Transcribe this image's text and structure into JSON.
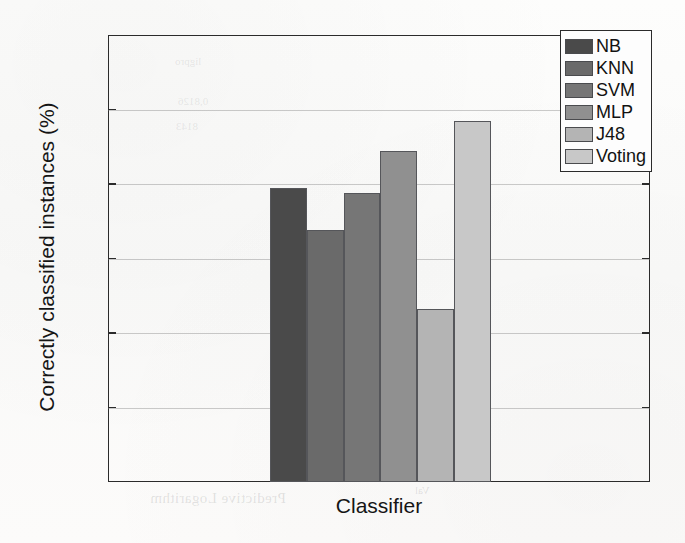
{
  "chart_data": {
    "type": "bar",
    "title": "",
    "xlabel": "Classifier",
    "ylabel": "Correctly classified instances (%)",
    "categories": [
      "NB",
      "KNN",
      "SVM",
      "MLP",
      "J48",
      "Voting"
    ],
    "values": [
      89.7,
      86.9,
      89.4,
      92.2,
      81.6,
      94.2
    ],
    "series": [
      {
        "name": "Correctly classified instances (%)",
        "values": [
          89.7,
          86.9,
          89.4,
          92.2,
          81.6,
          94.2
        ]
      }
    ],
    "ylim": [
      70,
      100
    ],
    "yticks": [
      70,
      75,
      80,
      85,
      90,
      95,
      100
    ],
    "ytick_labels": [
      "70",
      "75",
      "80",
      "85",
      "90",
      "95",
      "100"
    ],
    "xtick_labels": [],
    "grid": true,
    "grid_axis": "y",
    "legend_position": "upper right",
    "bar_colors": [
      "#4a4a4a",
      "#6a6a6a",
      "#767676",
      "#909090",
      "#b4b4b4",
      "#c8c8c8"
    ],
    "bar_edge_color": "#55565a",
    "legend": [
      {
        "label": "NB",
        "color": "#4a4a4a",
        "value": 89.7
      },
      {
        "label": "KNN",
        "color": "#6a6a6a",
        "value": 86.9
      },
      {
        "label": "SVM",
        "color": "#767676",
        "value": 89.4
      },
      {
        "label": "MLP",
        "color": "#909090",
        "value": 92.2
      },
      {
        "label": "J48",
        "color": "#b4b4b4",
        "value": 81.6
      },
      {
        "label": "Voting",
        "color": "#c8c8c8",
        "value": 94.2
      }
    ]
  },
  "axes": {
    "x_title": "Classifier",
    "y_title": "Correctly classified instances (%)"
  },
  "background_bleed": {
    "line_a": "Predictive Logarithm",
    "line_b": "Val",
    "line_c": "ligpro",
    "line_d": "0,8126",
    "line_e": "8143"
  }
}
